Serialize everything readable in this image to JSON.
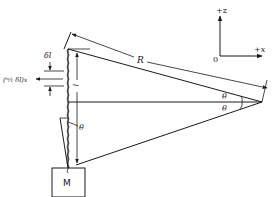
{
  "diagram": {
    "type": "physics-geometry",
    "axes": {
      "z_label": "+z",
      "x_label": "+x",
      "origin_label": "0"
    },
    "labels": {
      "distance": "R",
      "angle_upper": "θ",
      "angle_lower": "θ",
      "angle_left": "θ",
      "vertical_length": "l",
      "element_length": "δl",
      "displacement": "(ᵐ⁄₁ δl)x",
      "mass": "M"
    },
    "colors": {
      "stroke": "#1a1a1a",
      "background": "#ffffff"
    }
  }
}
